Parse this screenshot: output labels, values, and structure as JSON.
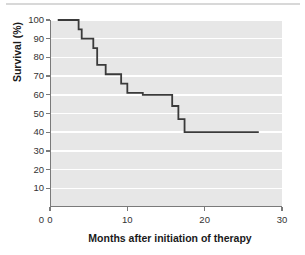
{
  "figure": {
    "decorations": {
      "top_rule": "horizontal-rule"
    }
  },
  "chart_data": {
    "type": "line",
    "subtype": "kaplan-meier-step",
    "title": "",
    "xlabel": "Months after initiation of therapy",
    "ylabel": "Survival (%)",
    "xlim": [
      0,
      30
    ],
    "ylim": [
      0,
      100
    ],
    "xticks": [
      0,
      10,
      20,
      30
    ],
    "xtick_labels": [
      "0",
      "10",
      "20",
      "30"
    ],
    "yticks": [
      0,
      10,
      20,
      30,
      40,
      50,
      60,
      70,
      80,
      90,
      100
    ],
    "ytick_labels": [
      "0",
      "10",
      "20",
      "30",
      "40",
      "50",
      "60",
      "70",
      "80",
      "90",
      "100"
    ],
    "grid": "horizontal-white-gridlines",
    "legend": "none",
    "plot_background": "#e7e7e7",
    "line_color": "#3a3a3a",
    "series": [
      {
        "name": "Survival",
        "x": [
          1,
          3.7,
          3.7,
          4.1,
          4.1,
          5.6,
          5.6,
          6.1,
          6.1,
          7.2,
          7.2,
          9.2,
          9.2,
          10.0,
          10.0,
          12.0,
          12.0,
          15.8,
          15.8,
          16.6,
          16.6,
          17.4,
          17.4,
          27.0
        ],
        "y": [
          100,
          100,
          95,
          95,
          90,
          90,
          85,
          85,
          76,
          76,
          71,
          71,
          66,
          66,
          61,
          61,
          60,
          60,
          54,
          54,
          47,
          47,
          40,
          40
        ]
      }
    ],
    "step_points": [
      {
        "month": 1.0,
        "survival": 100
      },
      {
        "month": 3.7,
        "survival": 95
      },
      {
        "month": 4.1,
        "survival": 90
      },
      {
        "month": 5.6,
        "survival": 85
      },
      {
        "month": 6.1,
        "survival": 76
      },
      {
        "month": 7.2,
        "survival": 71
      },
      {
        "month": 9.2,
        "survival": 66
      },
      {
        "month": 10.0,
        "survival": 61
      },
      {
        "month": 12.0,
        "survival": 60
      },
      {
        "month": 15.8,
        "survival": 54
      },
      {
        "month": 16.6,
        "survival": 47
      },
      {
        "month": 17.4,
        "survival": 40
      },
      {
        "month": 27.0,
        "survival": 40
      }
    ]
  }
}
